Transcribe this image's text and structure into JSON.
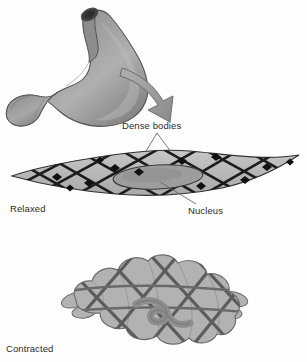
{
  "figure": {
    "background_color": "#fefefe"
  },
  "labels": {
    "dense_bodies": "Dense bodies",
    "nucleus": "Nucleus",
    "relaxed": "Relaxed",
    "contracted": "Contracted"
  },
  "illustrations": {
    "stomach": {
      "name": "stomach-illustration",
      "fill_dark": "#6e6e6e",
      "fill_mid": "#8f8f8f",
      "fill_light": "#b5b5b5",
      "outline": "#4a4a4a",
      "esophagus_opening_color": "#3d3d3d"
    },
    "contraction_arrow": {
      "name": "contraction-arrow",
      "fill": "#9a9a9a",
      "outline": "#6a6a6a",
      "direction": "curved-down-right"
    },
    "relaxed_cell": {
      "name": "relaxed-smooth-muscle-cell",
      "shape": "elongated-spindle",
      "body_fill": "#b9b9b9",
      "outline": "#3a3a3a",
      "filament_color": "#1d1d1d",
      "dense_body_color": "#111111",
      "nucleus_fill": "#9a9a9a",
      "nucleus_outline": "#3a3a3a"
    },
    "contracted_cell": {
      "name": "contracted-smooth-muscle-cell",
      "shape": "lobed-globular",
      "body_fill": "#b2b2b2",
      "outline": "#6d6d6d",
      "filament_color": "#5c5c5c",
      "nucleus_fill": "#9c9c9c",
      "nucleus_outline": "#6a6a6a"
    }
  },
  "leader_lines": {
    "dense_bodies_color": "#6a6a6a",
    "nucleus_color": "#6a6a6a"
  }
}
